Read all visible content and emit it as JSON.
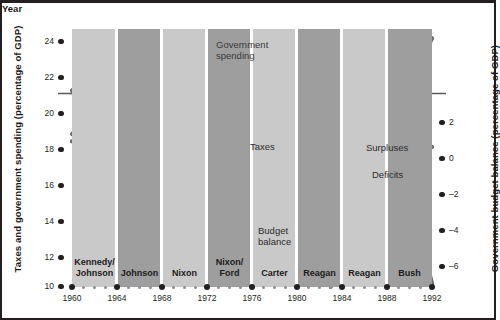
{
  "chart_data": {
    "type": "line",
    "title": "",
    "xlabel": "Year",
    "ylabel_left": "Taxes and government spending (percentage of GDP)",
    "ylabel_right": "Government budget balance (percentage of GDP)",
    "x": [
      1960,
      1961,
      1962,
      1963,
      1964,
      1965,
      1966,
      1967,
      1968,
      1969,
      1970,
      1971,
      1972,
      1973,
      1974,
      1975,
      1976,
      1977,
      1978,
      1979,
      1980,
      1981,
      1982,
      1983,
      1984,
      1985,
      1986,
      1987,
      1988,
      1989,
      1990,
      1991,
      1992
    ],
    "xlim": [
      1960,
      1992
    ],
    "xticks": [
      1960,
      1964,
      1968,
      1972,
      1976,
      1980,
      1984,
      1988,
      1992
    ],
    "ylim_left": [
      10,
      24
    ],
    "yticks_left": [
      10,
      12,
      14,
      16,
      18,
      20,
      22,
      24
    ],
    "ylim_right": [
      -6,
      2
    ],
    "yticks_right": [
      2,
      0,
      -2,
      -4,
      -6
    ],
    "grid": false,
    "legend": "inline-annotations",
    "series": [
      {
        "name": "Government spending",
        "axis": "left",
        "values": [
          18.3,
          18.8,
          19.2,
          18.9,
          18.6,
          18.5,
          19.0,
          19.5,
          19.6,
          19.1,
          19.3,
          19.3,
          19.6,
          18.7,
          19.0,
          21.3,
          21.4,
          20.8,
          20.7,
          20.2,
          21.7,
          22.2,
          23.1,
          23.5,
          22.2,
          22.9,
          22.5,
          21.6,
          21.3,
          21.2,
          21.8,
          22.3,
          23.5
        ]
      },
      {
        "name": "Taxes",
        "axis": "left",
        "values": [
          17.9,
          17.8,
          17.6,
          17.8,
          17.6,
          17.0,
          17.4,
          18.3,
          17.6,
          19.7,
          19.0,
          17.3,
          17.6,
          17.6,
          18.3,
          17.9,
          17.2,
          18.0,
          18.0,
          18.5,
          19.0,
          19.6,
          19.2,
          17.5,
          17.5,
          17.7,
          17.5,
          18.4,
          18.1,
          18.3,
          18.0,
          17.8,
          17.6
        ]
      },
      {
        "name": "Budget balance",
        "axis": "right",
        "values": [
          0.1,
          -0.6,
          -1.3,
          -0.8,
          -0.9,
          -0.2,
          -0.5,
          -1.1,
          -2.9,
          0.3,
          -0.3,
          -2.1,
          -2.0,
          -1.1,
          -0.4,
          -3.4,
          -4.2,
          -2.7,
          -2.7,
          -1.6,
          -2.7,
          -2.6,
          -4.0,
          -6.0,
          -4.8,
          -5.1,
          -5.0,
          -3.2,
          -3.1,
          -2.8,
          -3.9,
          -4.5,
          -5.9
        ]
      }
    ],
    "annotations": [
      {
        "text": "Government\nspending",
        "x": 1972.5,
        "y_left": 24.0
      },
      {
        "text": "Taxes",
        "x": 1976.5,
        "y_left": 18.2
      },
      {
        "text": "Surpluses",
        "x": 1986.5,
        "y_right": 0.75
      },
      {
        "text": "Deficits",
        "x": 1986.5,
        "y_right": -0.8
      },
      {
        "text": "Budget\nbalance",
        "x": 1980.0,
        "y_right": -3.5
      }
    ],
    "president_bands": [
      {
        "label": "Kennedy/\nJohnson",
        "start": 1960,
        "end": 1964,
        "shade": "light"
      },
      {
        "label": "Johnson",
        "start": 1964,
        "end": 1968,
        "shade": "dark"
      },
      {
        "label": "Nixon",
        "start": 1968,
        "end": 1972,
        "shade": "light"
      },
      {
        "label": "Nixon/\nFord",
        "start": 1972,
        "end": 1976,
        "shade": "dark"
      },
      {
        "label": "Carter",
        "start": 1976,
        "end": 1980,
        "shade": "light"
      },
      {
        "label": "Reagan",
        "start": 1980,
        "end": 1984,
        "shade": "dark"
      },
      {
        "label": "Reagan",
        "start": 1984,
        "end": 1988,
        "shade": "light"
      },
      {
        "label": "Bush",
        "start": 1988,
        "end": 1992,
        "shade": "dark"
      }
    ],
    "colors": {
      "band_light": "#c9c9c9",
      "band_dark": "#9e9e9e",
      "line": "#6b6b6b",
      "zero_line": "#5a5a5a",
      "text": "#231f20",
      "background": "#ffffff"
    }
  },
  "axes": {
    "left": {
      "title": "Taxes and government spending (percentage of GDP)",
      "ticks": [
        "24",
        "22",
        "20",
        "18",
        "16",
        "14",
        "12",
        "10"
      ]
    },
    "right": {
      "title": "Government budget balance (percentage of GDP)",
      "ticks": [
        "2",
        "0",
        "–2",
        "–4",
        "–6"
      ]
    },
    "bottom": {
      "title": "Year",
      "ticks": [
        "1960",
        "1964",
        "1968",
        "1972",
        "1976",
        "1980",
        "1984",
        "1988",
        "1992"
      ]
    }
  },
  "labels": {
    "government_spending": "Government",
    "government_spending2": "spending",
    "taxes": "Taxes",
    "surpluses": "Surpluses",
    "deficits": "Deficits",
    "budget_balance": "Budget",
    "budget_balance2": "balance"
  },
  "bands": {
    "kennedy_johnson_1": "Kennedy/",
    "kennedy_johnson_2": "Johnson",
    "johnson": "Johnson",
    "nixon": "Nixon",
    "nixon_ford_1": "Nixon/",
    "nixon_ford_2": "Ford",
    "carter": "Carter",
    "reagan1": "Reagan",
    "reagan2": "Reagan",
    "bush": "Bush"
  }
}
